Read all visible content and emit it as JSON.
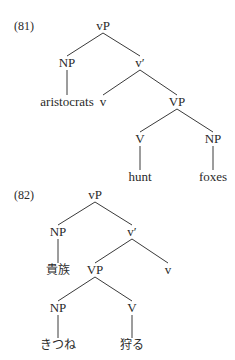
{
  "diagram": {
    "type": "syntax-tree",
    "line_color": "#3a3a3a",
    "trees": [
      {
        "label": "(81)",
        "label_pos": [
          14,
          26
        ],
        "nodes": [
          {
            "id": "vP",
            "text": "vP",
            "x": 103,
            "y": 26
          },
          {
            "id": "NP1",
            "text": "NP",
            "x": 67,
            "y": 63
          },
          {
            "id": "vbar",
            "text": "v′",
            "x": 140,
            "y": 63
          },
          {
            "id": "aristocrats",
            "text": "aristocrats",
            "x": 67,
            "y": 102
          },
          {
            "id": "v",
            "text": "v",
            "x": 103,
            "y": 102
          },
          {
            "id": "VP",
            "text": "VP",
            "x": 177,
            "y": 102
          },
          {
            "id": "V",
            "text": "V",
            "x": 140,
            "y": 139
          },
          {
            "id": "NP2",
            "text": "NP",
            "x": 213,
            "y": 139
          },
          {
            "id": "hunt",
            "text": "hunt",
            "x": 140,
            "y": 177
          },
          {
            "id": "foxes",
            "text": "foxes",
            "x": 213,
            "y": 177
          }
        ],
        "edges": [
          [
            "vP",
            "NP1"
          ],
          [
            "vP",
            "vbar"
          ],
          [
            "NP1",
            "aristocrats"
          ],
          [
            "vbar",
            "v"
          ],
          [
            "vbar",
            "VP"
          ],
          [
            "VP",
            "V"
          ],
          [
            "VP",
            "NP2"
          ],
          [
            "V",
            "hunt"
          ],
          [
            "NP2",
            "foxes"
          ]
        ]
      },
      {
        "label": "(82)",
        "label_pos": [
          14,
          195
        ],
        "nodes": [
          {
            "id": "vP",
            "text": "vP",
            "x": 95,
            "y": 195
          },
          {
            "id": "NP1",
            "text": "NP",
            "x": 58,
            "y": 232
          },
          {
            "id": "vbar",
            "text": "v′",
            "x": 132,
            "y": 232
          },
          {
            "id": "kizoku",
            "text": "貴族",
            "x": 58,
            "y": 270,
            "jp": true
          },
          {
            "id": "VP",
            "text": "VP",
            "x": 95,
            "y": 270
          },
          {
            "id": "v",
            "text": "v",
            "x": 168,
            "y": 270
          },
          {
            "id": "NP2",
            "text": "NP",
            "x": 58,
            "y": 308
          },
          {
            "id": "V",
            "text": "V",
            "x": 132,
            "y": 308
          },
          {
            "id": "kitsune",
            "text": "きつね",
            "x": 58,
            "y": 345,
            "jp": true
          },
          {
            "id": "karu",
            "text": "狩る",
            "x": 132,
            "y": 345,
            "jp": true
          }
        ],
        "edges": [
          [
            "vP",
            "NP1"
          ],
          [
            "vP",
            "vbar"
          ],
          [
            "NP1",
            "kizoku"
          ],
          [
            "vbar",
            "VP"
          ],
          [
            "vbar",
            "v"
          ],
          [
            "VP",
            "NP2"
          ],
          [
            "VP",
            "V"
          ],
          [
            "NP2",
            "kitsune"
          ],
          [
            "V",
            "karu"
          ]
        ]
      }
    ]
  }
}
